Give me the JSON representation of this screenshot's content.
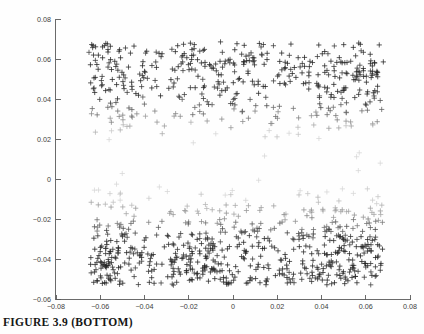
{
  "figure": {
    "caption": "FIGURE 3.9 (BOTTOM)"
  },
  "chart_data": {
    "type": "scatter",
    "title": "",
    "xlabel": "",
    "ylabel": "",
    "xlim": [
      -0.08,
      0.08
    ],
    "ylim": [
      -0.06,
      0.08
    ],
    "xticks": [
      -0.08,
      -0.06,
      -0.04,
      -0.02,
      0,
      0.02,
      0.04,
      0.06,
      0.08
    ],
    "xticklabels": [
      "-0.08",
      "-0.06",
      "-0.04",
      "-0.02",
      "0",
      "0.02",
      "0.04",
      "0.06",
      "0.08"
    ],
    "yticks": [
      -0.06,
      -0.04,
      -0.02,
      0,
      0.02,
      0.04,
      0.06,
      0.08
    ],
    "yticklabels": [
      "-0.06",
      "-0.04",
      "-0.02",
      "0",
      "0.02",
      "0.04",
      "0.06",
      "0.08"
    ],
    "grid": false,
    "legend": null,
    "marker": "plus",
    "marker_size": 2.6,
    "point_count": 1100,
    "color_scheme": {
      "dark": "#2a2a2a",
      "mid": "#7d7d7d",
      "light": "#c9c9c9",
      "axis": "#5a5a5a",
      "background": "#fefefe"
    },
    "x_data_range": [
      -0.065,
      0.068
    ],
    "y_data_range": [
      -0.053,
      0.068
    ],
    "series": [
      {
        "name": "points",
        "n": 1100
      }
    ]
  }
}
